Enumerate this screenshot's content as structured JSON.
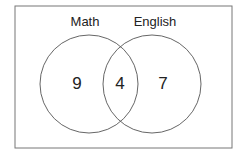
{
  "diagram": {
    "type": "venn",
    "sets": [
      {
        "label": "Math",
        "only_count": "9"
      },
      {
        "label": "English",
        "only_count": "7"
      }
    ],
    "intersection_count": "4",
    "colors": {
      "stroke": "#555555",
      "frame": "#666666",
      "text": "#222222"
    }
  }
}
